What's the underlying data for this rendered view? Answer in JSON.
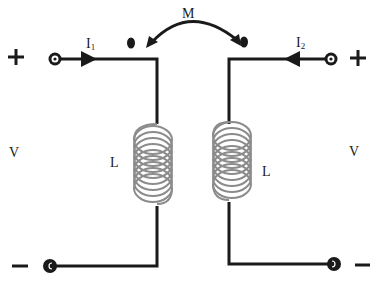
{
  "diagram": {
    "type": "coupled-inductors",
    "mutual_label": "M",
    "left": {
      "plus_sign": "+",
      "minus_sign": "−",
      "voltage_label": "V",
      "inductor_label": "L",
      "current_label": "I",
      "current_subscript": "1",
      "current_direction": "into-top-terminal"
    },
    "right": {
      "plus_sign": "+",
      "minus_sign": "−",
      "voltage_label": "V",
      "inductor_label": "L",
      "current_label": "I",
      "current_subscript": "2",
      "current_direction": "into-top-terminal"
    },
    "dot_convention": [
      "top-left-coil",
      "top-right-coil"
    ],
    "colors": {
      "wire": "#1a1a1a",
      "coil": "#8c8c8c",
      "background": "#ffffff"
    }
  }
}
